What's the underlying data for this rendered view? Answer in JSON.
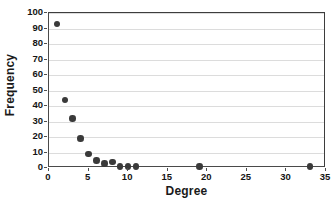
{
  "chart_data": {
    "type": "scatter",
    "title": "",
    "xlabel": "Degree",
    "ylabel": "Frequency",
    "xlim": [
      0,
      35
    ],
    "ylim": [
      0,
      100
    ],
    "xticks": [
      0,
      5,
      10,
      15,
      20,
      25,
      30,
      35
    ],
    "yticks": [
      0,
      10,
      20,
      30,
      40,
      50,
      60,
      70,
      80,
      90,
      100
    ],
    "grid": "horizontal",
    "legend": "none",
    "marker": "filled-circle",
    "series": [
      {
        "name": "Degree distribution",
        "color": "#3a3a3a",
        "points": [
          {
            "x": 1,
            "y": 93
          },
          {
            "x": 2,
            "y": 44
          },
          {
            "x": 3,
            "y": 32
          },
          {
            "x": 4,
            "y": 19
          },
          {
            "x": 5,
            "y": 9
          },
          {
            "x": 6,
            "y": 5
          },
          {
            "x": 7,
            "y": 3
          },
          {
            "x": 8,
            "y": 4
          },
          {
            "x": 9,
            "y": 1
          },
          {
            "x": 10,
            "y": 1
          },
          {
            "x": 11,
            "y": 1
          },
          {
            "x": 19,
            "y": 1
          },
          {
            "x": 33,
            "y": 1
          }
        ]
      }
    ]
  },
  "colors": {
    "marker": "#3a3a3a",
    "gridline": "#dcdcdc",
    "axis": "#4a4a4a",
    "text": "#141414",
    "background": "#ffffff"
  }
}
